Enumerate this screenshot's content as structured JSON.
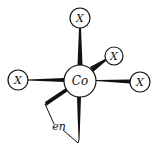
{
  "diagram": {
    "type": "octahedral coordination complex",
    "central_atom": {
      "label": "Co"
    },
    "ligands": [
      {
        "id": "top",
        "label": "X"
      },
      {
        "id": "upper-right",
        "label": "X"
      },
      {
        "id": "right",
        "label": "X"
      },
      {
        "id": "left",
        "label": "X"
      }
    ],
    "chelate": {
      "label": "en"
    }
  },
  "colors": {
    "stroke": "#111111",
    "background": "#ffffff"
  }
}
